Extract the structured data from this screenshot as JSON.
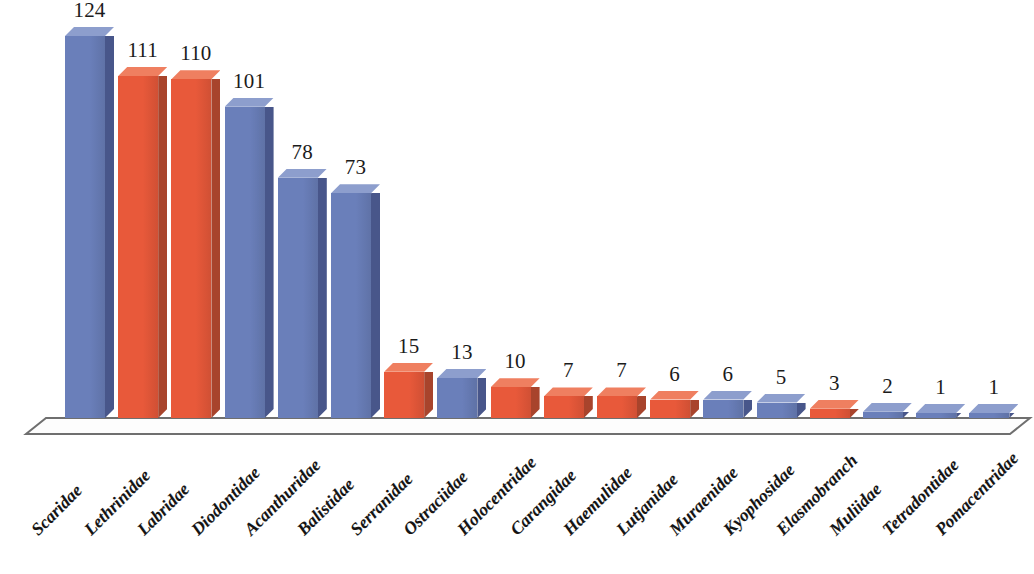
{
  "chart_data": {
    "type": "bar",
    "title": "",
    "subtitle": "",
    "xlabel": "",
    "ylabel": "",
    "ylim": [
      0,
      124
    ],
    "grid": false,
    "legend": "none",
    "orientation": "vertical",
    "style": "3d-columns",
    "value_labels_shown": true,
    "categories": [
      "Scaridae",
      "Lethrinidae",
      "Labridae",
      "Diodontidae",
      "Acanthuridae",
      "Balistidae",
      "Serranidae",
      "Ostraciidae",
      "Holocentridae",
      "Carangidae",
      "Haemulidae",
      "Lutjanidae",
      "Muraenidae",
      "Kyophosidae",
      "Elasmobranch",
      "Muliidae",
      "Tetradontidae",
      "Pomacentridae"
    ],
    "values": [
      124,
      111,
      110,
      101,
      78,
      73,
      15,
      13,
      10,
      7,
      7,
      6,
      6,
      5,
      3,
      2,
      1,
      1
    ],
    "bar_colors": [
      "blue",
      "orange",
      "orange",
      "blue",
      "blue",
      "blue",
      "orange",
      "blue",
      "orange",
      "orange",
      "orange",
      "orange",
      "blue",
      "blue",
      "orange",
      "blue",
      "blue",
      "blue"
    ]
  },
  "colors": {
    "blue_front": "#6a7fba",
    "blue_side": "#48568a",
    "blue_top": "#8d9ecd",
    "orange_front": "#e8593a",
    "orange_side": "#a8442c",
    "orange_top": "#ef7f60",
    "floor_fill": "#fdfdfd",
    "floor_stroke": "#6f6f6f",
    "text": "#1b1b1b",
    "background": "#ffffff"
  }
}
